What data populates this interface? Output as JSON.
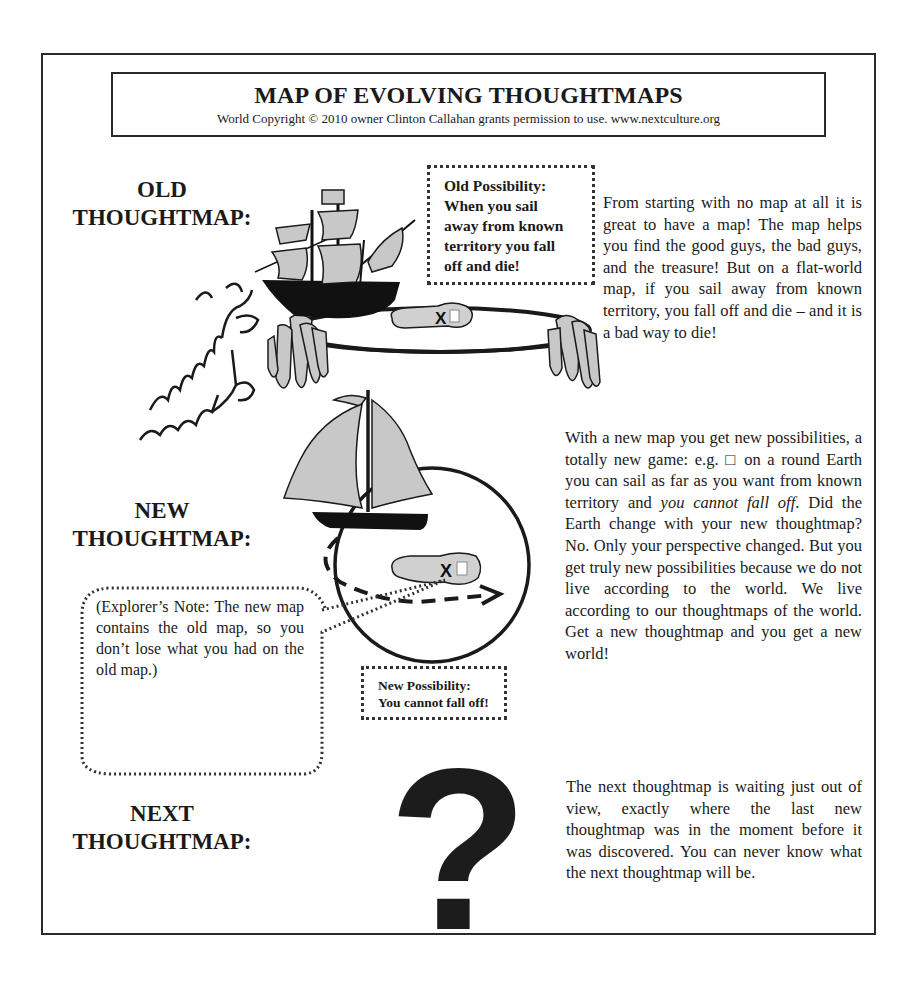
{
  "header": {
    "title": "MAP OF EVOLVING THOUGHTMAPS",
    "copyright": "World Copyright © 2010 owner Clinton Callahan grants permission to use. www.nextculture.org"
  },
  "sections": {
    "old": {
      "label_line1": "OLD",
      "label_line2": "THOUGHTMAP:",
      "callout": {
        "line1": "Old Possibility:",
        "line2": "When you sail",
        "line3": "away from known",
        "line4": "territory you fall",
        "line5": "off and die!"
      },
      "description": "From starting with no map at all it is great to have a map! The map helps you find the good guys, the bad guys, and the treasure! But on a flat-world map, if you sail away from known territory, you fall off and die – and it is a bad way to die!",
      "illustration": {
        "items": [
          "galleon-ship",
          "flat-world-disk",
          "treasure-island",
          "x-mark",
          "sea-dragon",
          "waterfall-edges"
        ],
        "island_mark": "X"
      }
    },
    "new": {
      "label_line1": "NEW",
      "label_line2": "THOUGHTMAP:",
      "callout": {
        "line1": "New Possibility:",
        "line2": "You cannot fall off!"
      },
      "explorer_note": "(Explorer’s Note: The new map contains the old map, so you don’t lose what you had on the old map.)",
      "description_part1": "With a new map you get new possibilities, a totally new game: e.g. □ on a round Earth you can sail as far as you want from known territory and ",
      "description_italic": "you cannot fall off",
      "description_part2": ". Did the Earth change with your new thoughtmap? No. Only your perspective changed. But you get truly new possibilities because we do not live according to the world. We live according to our thoughtmaps of the world. Get a new thoughtmap and you get a new world!",
      "illustration": {
        "items": [
          "sailboat",
          "round-globe",
          "treasure-island",
          "x-mark",
          "dashed-route-arrow"
        ],
        "island_mark": "X"
      }
    },
    "next": {
      "label_line1": "NEXT",
      "label_line2": "THOUGHTMAP:",
      "symbol": "?",
      "description": "The next thoughtmap is waiting just out of view, exactly where the last new thoughtmap was in the moment before it was discovered. You can never know what the next thoughtmap will be."
    }
  },
  "colors": {
    "ink": "#1a1a1a",
    "sail_gray": "#c8c8c8",
    "hull": "#111111",
    "paper": "#ffffff"
  }
}
